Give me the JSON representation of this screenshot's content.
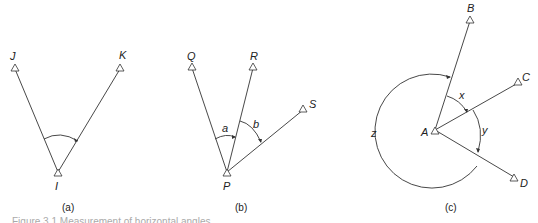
{
  "panels": {
    "a": {
      "caption": "(a)",
      "stations": [
        {
          "label": "J",
          "x": 15,
          "y": 68
        },
        {
          "label": "K",
          "x": 120,
          "y": 68
        },
        {
          "label": "I",
          "x": 58,
          "y": 173
        }
      ]
    },
    "b": {
      "caption": "(b)",
      "stations": [
        {
          "label": "Q",
          "x": 192,
          "y": 67
        },
        {
          "label": "R",
          "x": 253,
          "y": 67
        },
        {
          "label": "S",
          "x": 303,
          "y": 109
        },
        {
          "label": "P",
          "x": 227,
          "y": 173
        }
      ],
      "angles": [
        "a",
        "b"
      ]
    },
    "c": {
      "caption": "(c)",
      "stations": [
        {
          "label": "B",
          "x": 470,
          "y": 20
        },
        {
          "label": "C",
          "x": 518,
          "y": 82
        },
        {
          "label": "A",
          "x": 435,
          "y": 131
        },
        {
          "label": "D",
          "x": 514,
          "y": 178
        }
      ],
      "angles": [
        "x",
        "y",
        "z"
      ]
    }
  },
  "figure_caption_fragment": "Figure 3.1  Measurement of horizontal angles"
}
